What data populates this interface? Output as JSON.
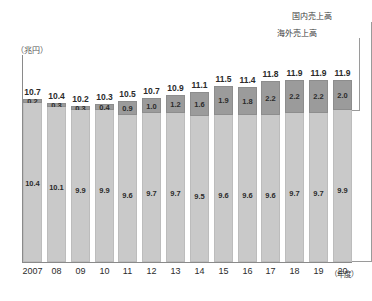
{
  "axis": {
    "unit_label": "（兆円）",
    "x_axis_suffix": "（年度）"
  },
  "legend": {
    "domestic_label": "国内売上高",
    "overseas_label": "海外売上高"
  },
  "chart_data": {
    "type": "bar",
    "stacked": true,
    "title": "",
    "xlabel": "（年度）",
    "ylabel": "（兆円）",
    "ylim": [
      0,
      13.5
    ],
    "grid": false,
    "legend_position": "top-right",
    "categories": [
      "2007",
      "08",
      "09",
      "10",
      "11",
      "12",
      "13",
      "14",
      "15",
      "16",
      "17",
      "18",
      "19",
      "20"
    ],
    "series": [
      {
        "name": "国内売上高",
        "values": [
          10.4,
          10.1,
          9.9,
          9.9,
          9.6,
          9.7,
          9.7,
          9.5,
          9.6,
          9.6,
          9.6,
          9.7,
          9.7,
          9.9
        ]
      },
      {
        "name": "海外売上高",
        "values": [
          0.2,
          0.3,
          0.3,
          0.4,
          0.9,
          1.0,
          1.2,
          1.6,
          1.9,
          1.8,
          2.2,
          2.2,
          2.2,
          2.0
        ]
      }
    ],
    "totals": [
      10.7,
      10.4,
      10.2,
      10.3,
      10.5,
      10.7,
      10.9,
      11.1,
      11.5,
      11.4,
      11.8,
      11.9,
      11.9,
      11.9
    ],
    "colors": {
      "domestic": "#c9c9c9",
      "overseas": "#9b9b9b",
      "axis": "#8a8a8a",
      "text": "#2b2b2b"
    }
  }
}
